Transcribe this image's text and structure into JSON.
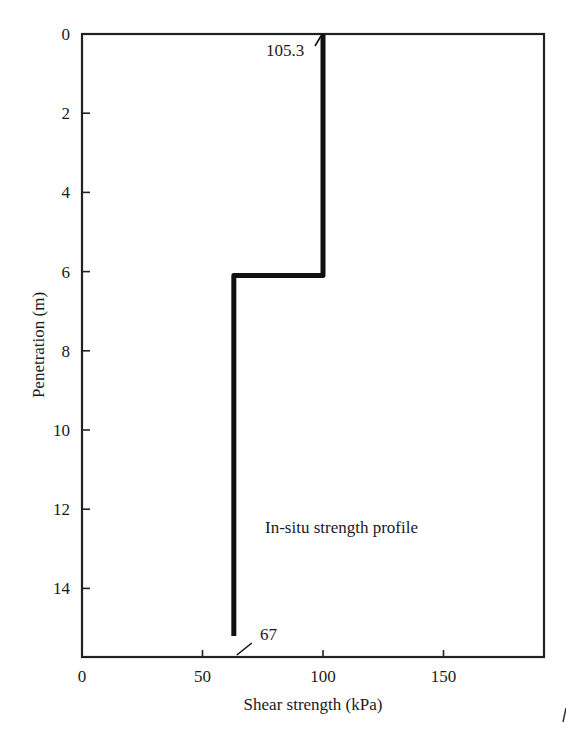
{
  "chart_data": {
    "type": "line",
    "title": "",
    "xlabel": "Shear strength (kPa)",
    "ylabel": "Penetration (m)",
    "xlim": [
      0,
      192
    ],
    "ylim": [
      15.2,
      0
    ],
    "y_inverted": true,
    "grid": false,
    "legend": null,
    "x_ticks": [
      0,
      50,
      100,
      150
    ],
    "x_tick_labels": [
      "0",
      "50",
      "100",
      "150"
    ],
    "y_ticks": [
      0,
      2,
      4,
      6,
      8,
      10,
      12,
      14
    ],
    "y_tick_labels": [
      "0",
      "2",
      "4",
      "6",
      "8",
      "10",
      "12",
      "14"
    ],
    "series": [
      {
        "name": "In-situ strength profile",
        "points": [
          {
            "x": 100,
            "y": 0
          },
          {
            "x": 100,
            "y": 6.1
          },
          {
            "x": 63,
            "y": 6.1
          },
          {
            "x": 63,
            "y": 15.2
          }
        ]
      }
    ],
    "annotations": [
      {
        "text": "105.3",
        "at": {
          "x": 100,
          "y": 0
        },
        "position": "left-below",
        "leader_line": true
      },
      {
        "text": "67",
        "at": {
          "x": 63,
          "y": 15.2
        },
        "position": "right-above",
        "leader_line": true
      },
      {
        "text": "In-situ strength profile",
        "at": {
          "x": 76,
          "y": 12.2
        }
      }
    ]
  }
}
